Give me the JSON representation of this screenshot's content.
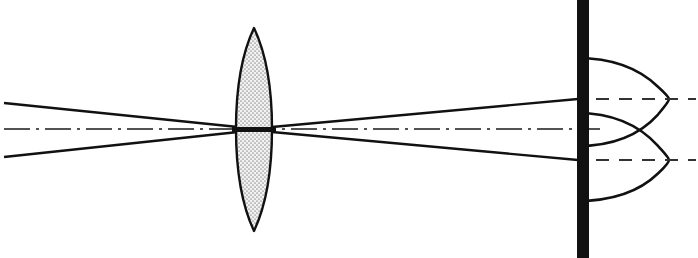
{
  "figure": {
    "type": "optical-ray-diagram",
    "width": 698,
    "height": 258,
    "background_color": "#ffffff",
    "ink_color": "#111111"
  },
  "optical_axis": {
    "label": "optical axis",
    "style": "dash-dot",
    "y": 129,
    "x_start": 4,
    "x_end": 600,
    "color": "#1a1a1a",
    "stroke_width": 1.6,
    "dash_pattern": "26 6 3 6"
  },
  "lens": {
    "label": "biconvex converging lens",
    "center_x": 254,
    "center_y": 129,
    "top_tip_y": 28,
    "bottom_tip_y": 231,
    "left_edge_x": 236,
    "right_edge_x": 272,
    "half_thickness": 18,
    "fill_color": "#d8d8d8",
    "fill_pattern": "stipple",
    "outline_color": "#111111",
    "outline_width": 2.4
  },
  "screen": {
    "label": "observation screen",
    "x": 577,
    "width": 12,
    "y": 0,
    "height": 258,
    "color": "#111111"
  },
  "incoming_beam": {
    "label": "incoming converging beam",
    "upper_ray": {
      "x0": 4,
      "y0": 103,
      "x1": 238,
      "y1": 127
    },
    "lower_ray": {
      "x0": 4,
      "y0": 157,
      "x1": 238,
      "y1": 132
    },
    "stroke_width": 2.4,
    "color": "#111111"
  },
  "outgoing_beam": {
    "label": "outgoing diverging beam to screen",
    "upper_ray": {
      "x0": 272,
      "y0": 127,
      "x1": 578,
      "y1": 99
    },
    "lower_ray": {
      "x0": 272,
      "y0": 132,
      "x1": 578,
      "y1": 160
    },
    "stroke_width": 2.4,
    "color": "#111111"
  },
  "focus_marker": {
    "label": "waist at lens plane",
    "x0": 232,
    "x1": 276,
    "y": 129,
    "stroke_width": 5,
    "color": "#111111"
  },
  "intensity_profiles": [
    {
      "name": "upper-intensity-profile",
      "label": "irradiance profile of upper spot",
      "baseline_y": 99,
      "baseline_x_start": 577,
      "peak_x": 669,
      "curve_top_y": 58,
      "curve_bottom_y": 146,
      "color": "#111111",
      "stroke_width": 2.6
    },
    {
      "name": "lower-intensity-profile",
      "label": "irradiance profile of lower spot",
      "baseline_y": 160,
      "baseline_x_start": 577,
      "peak_x": 669,
      "curve_top_y": 113,
      "curve_bottom_y": 201,
      "color": "#111111",
      "stroke_width": 2.6
    }
  ],
  "reference_lines": [
    {
      "name": "upper-reference-line",
      "label": "upper spot center reference",
      "y": 99,
      "x_start": 596,
      "x_end": 696,
      "style": "dashed",
      "dash_pattern": "13 10",
      "color": "#333333",
      "stroke_width": 2
    },
    {
      "name": "lower-reference-line",
      "label": "lower spot center reference",
      "y": 160,
      "x_start": 596,
      "x_end": 696,
      "style": "dashed",
      "dash_pattern": "13 10",
      "color": "#333333",
      "stroke_width": 2
    }
  ],
  "crossing_point": {
    "label": "profiles overlap on axis",
    "x": 615,
    "y": 130
  }
}
